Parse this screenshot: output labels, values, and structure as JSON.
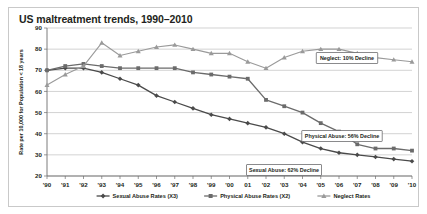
{
  "chart_data": {
    "type": "line",
    "title": "US maltreatment trends, 1990–2010",
    "xlabel": "",
    "ylabel": "Rate per 10,000 for Population < 18 years",
    "ylim": [
      20,
      90
    ],
    "yticks": [
      20,
      30,
      40,
      50,
      60,
      70,
      80,
      90
    ],
    "ytick_labels": [
      "20",
      "30",
      "40",
      "50",
      "60",
      "70",
      "80",
      "90"
    ],
    "grid": true,
    "legend_position": "bottom",
    "categories": [
      1990,
      1991,
      1992,
      1993,
      1994,
      1995,
      1996,
      1997,
      1998,
      1999,
      2000,
      2001,
      2002,
      2003,
      2004,
      2005,
      2006,
      2007,
      2008,
      2009,
      2010
    ],
    "xtick_labels": [
      "'90",
      "'91",
      "'92",
      "'93",
      "'94",
      "'95",
      "'96",
      "'97",
      "'98",
      "'99",
      "'00",
      "01",
      "'02",
      "'03",
      "'04",
      "'05",
      "'06",
      "'07",
      "'08",
      "'09",
      "'10"
    ],
    "series": [
      {
        "name": "Sexual Abuse Rates (X3)",
        "marker": "diamond",
        "color": "#4a4a4a",
        "values": [
          70,
          71,
          71,
          69,
          66,
          63,
          58,
          55,
          52,
          49,
          47,
          45,
          43,
          40,
          36,
          33,
          31,
          30,
          29,
          28,
          27
        ]
      },
      {
        "name": "Physical Abuse Rates (X2)",
        "marker": "square",
        "color": "#6b6b6b",
        "values": [
          70,
          72,
          73,
          72,
          71,
          71,
          71,
          71,
          69,
          68,
          67,
          66,
          56,
          53,
          50,
          45,
          41,
          35,
          33,
          33,
          32
        ]
      },
      {
        "name": "Neglect Rates",
        "marker": "triangle",
        "color": "#9a9a9a",
        "values": [
          63,
          68,
          72,
          83,
          77,
          79,
          81,
          82,
          80,
          78,
          78,
          74,
          71,
          76,
          79,
          80,
          80,
          78,
          76,
          75,
          74
        ]
      }
    ],
    "annotations": [
      {
        "name": "neglect-annotation",
        "text": "Neglect: 10% Decline",
        "x": 338,
        "y": 50
      },
      {
        "name": "physical-abuse-annotation",
        "text": "Physical Abuse: 56% Decline",
        "x": 333,
        "y": 128
      },
      {
        "name": "sexual-abuse-annotation",
        "text": "Sexual Abuse: 62% Decline",
        "x": 275,
        "y": 162
      }
    ]
  }
}
